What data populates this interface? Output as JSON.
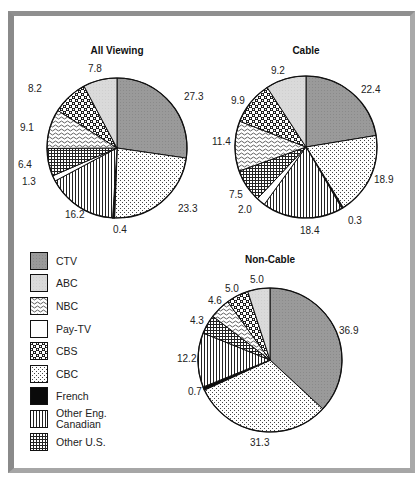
{
  "chart_data": [
    {
      "type": "pie",
      "title": "All Viewing",
      "start_angle_deg": 0,
      "direction": "clockwise",
      "slices": [
        {
          "label": "CTV",
          "value": 27.3
        },
        {
          "label": "CBC",
          "value": 23.3
        },
        {
          "label": "French",
          "value": 0.4
        },
        {
          "label": "Other Eng. Canadian",
          "value": 16.2
        },
        {
          "label": "Pay-TV",
          "value": 1.3
        },
        {
          "label": "Other U.S.",
          "value": 6.4
        },
        {
          "label": "NBC",
          "value": 9.1
        },
        {
          "label": "CBS",
          "value": 8.2
        },
        {
          "label": "ABC",
          "value": 7.8
        }
      ]
    },
    {
      "type": "pie",
      "title": "Cable",
      "start_angle_deg": 0,
      "direction": "clockwise",
      "slices": [
        {
          "label": "CTV",
          "value": 22.4
        },
        {
          "label": "CBC",
          "value": 18.9
        },
        {
          "label": "French",
          "value": 0.3
        },
        {
          "label": "Other Eng. Canadian",
          "value": 18.4
        },
        {
          "label": "Pay-TV",
          "value": 2.0
        },
        {
          "label": "Other U.S.",
          "value": 7.5
        },
        {
          "label": "NBC",
          "value": 11.4
        },
        {
          "label": "CBS",
          "value": 9.9
        },
        {
          "label": "ABC",
          "value": 9.2
        }
      ]
    },
    {
      "type": "pie",
      "title": "Non-Cable",
      "start_angle_deg": 0,
      "direction": "clockwise",
      "slices": [
        {
          "label": "CTV",
          "value": 36.9
        },
        {
          "label": "CBC",
          "value": 31.3
        },
        {
          "label": "French",
          "value": 0.7
        },
        {
          "label": "Other Eng. Canadian",
          "value": 12.2
        },
        {
          "label": "Other U.S.",
          "value": 4.3
        },
        {
          "label": "NBC",
          "value": 4.6
        },
        {
          "label": "CBS",
          "value": 5.0
        },
        {
          "label": "ABC",
          "value": 5.0
        }
      ]
    }
  ],
  "pies": [
    {
      "title": "All Viewing",
      "cx": 117,
      "cy": 148,
      "r": 70,
      "title_y": 54,
      "labels": [
        {
          "text": "27.3",
          "x": 184,
          "y": 100
        },
        {
          "text": "23.3",
          "x": 178,
          "y": 212
        },
        {
          "text": "0.4",
          "x": 113,
          "y": 233
        },
        {
          "text": "16.2",
          "x": 65,
          "y": 218
        },
        {
          "text": "1.3",
          "x": 22,
          "y": 185
        },
        {
          "text": "6.4",
          "x": 18,
          "y": 168
        },
        {
          "text": "9.1",
          "x": 20,
          "y": 131
        },
        {
          "text": "8.2",
          "x": 28,
          "y": 92
        },
        {
          "text": "7.8",
          "x": 88,
          "y": 72
        }
      ]
    },
    {
      "title": "Cable",
      "cx": 306,
      "cy": 147,
      "r": 71,
      "title_y": 54,
      "labels": [
        {
          "text": "22.4",
          "x": 361,
          "y": 93
        },
        {
          "text": "18.9",
          "x": 374,
          "y": 183
        },
        {
          "text": "0.3",
          "x": 348,
          "y": 224
        },
        {
          "text": "18.4",
          "x": 300,
          "y": 234
        },
        {
          "text": "2.0",
          "x": 238,
          "y": 213
        },
        {
          "text": "7.5",
          "x": 229,
          "y": 198
        },
        {
          "text": "11.4",
          "x": 212,
          "y": 145
        },
        {
          "text": "9.9",
          "x": 231,
          "y": 104
        },
        {
          "text": "9.2",
          "x": 271,
          "y": 74
        }
      ]
    },
    {
      "title": "Non-Cable",
      "cx": 270,
      "cy": 360,
      "r": 72,
      "title_y": 263,
      "labels": [
        {
          "text": "36.9",
          "x": 339,
          "y": 334
        },
        {
          "text": "31.3",
          "x": 250,
          "y": 446
        },
        {
          "text": "0.7",
          "x": 188,
          "y": 395
        },
        {
          "text": "12.2",
          "x": 177,
          "y": 362
        },
        {
          "text": "4.3",
          "x": 190,
          "y": 324
        },
        {
          "text": "4.6",
          "x": 208,
          "y": 304
        },
        {
          "text": "5.0",
          "x": 225,
          "y": 292
        },
        {
          "text": "5.0",
          "x": 250,
          "y": 283
        }
      ]
    }
  ],
  "legend": {
    "items": [
      {
        "label": "CTV",
        "pattern": "ctv"
      },
      {
        "label": "ABC",
        "pattern": "abc"
      },
      {
        "label": "NBC",
        "pattern": "nbc"
      },
      {
        "label": "Pay-TV",
        "pattern": "paytv"
      },
      {
        "label": "CBS",
        "pattern": "cbs"
      },
      {
        "label": "CBC",
        "pattern": "cbc"
      },
      {
        "label": "French",
        "pattern": "french"
      },
      {
        "label": "Other Eng.\nCanadian",
        "pattern": "othereng"
      },
      {
        "label": "Other U.S.",
        "pattern": "otherus"
      }
    ]
  },
  "colors": {
    "ctv": "#9a9a9a",
    "abc": "#d9d9d9",
    "outline": "#111111",
    "frame": "#8f8f8f"
  }
}
